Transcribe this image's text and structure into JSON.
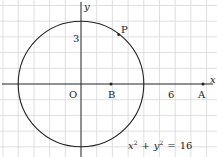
{
  "diagram": {
    "type": "coordinate-plane",
    "equation": "x² + y² = 16",
    "equation_parts": {
      "x": "x",
      "sup1": "2",
      "plus": "+",
      "y": "y",
      "sup2": "2",
      "eq": "=",
      "rhs": "16"
    },
    "axes": {
      "x_label": "x",
      "y_label": "y",
      "origin_label": "O"
    },
    "tick_labels": {
      "y3": "3",
      "x6": "6"
    },
    "points": {
      "P": {
        "label": "P",
        "x": 2.4,
        "y": 3.2
      },
      "B": {
        "label": "B",
        "x": 2,
        "y": 0
      },
      "A": {
        "label": "A",
        "x": 8,
        "y": 0
      }
    },
    "circle": {
      "center": [
        0,
        0
      ],
      "radius": 4
    },
    "colors": {
      "grid": "#d8d8d8",
      "ink": "#222222",
      "background": "#ffffff"
    }
  }
}
